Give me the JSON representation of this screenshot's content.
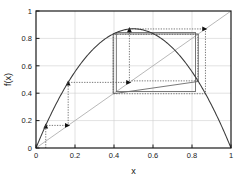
{
  "chart_data": {
    "type": "line",
    "title": "",
    "xlabel": "x",
    "ylabel": "f(x)",
    "xlim": [
      0,
      1
    ],
    "ylim": [
      0,
      1
    ],
    "grid": true,
    "legend": "none",
    "xticks": [
      "0",
      "0.2",
      "0.4",
      "0.6",
      "0.8",
      "1"
    ],
    "xtickvalues": [
      0,
      0.2,
      0.4,
      0.6,
      0.8,
      1
    ],
    "yticks": [
      "0",
      "0.2",
      "0.4",
      "0.6",
      "0.8",
      "1"
    ],
    "ytickvalues": [
      0,
      0.2,
      0.4,
      0.6,
      0.8,
      1
    ],
    "series": [
      {
        "name": "f(x) = r x (1 - x)",
        "style": "solid-curve",
        "r": 3.48,
        "peak": {
          "x": 0.5,
          "y": 0.87
        },
        "x": [
          0.0,
          0.05,
          0.1,
          0.15,
          0.2,
          0.25,
          0.3,
          0.35,
          0.4,
          0.45,
          0.5,
          0.55,
          0.6,
          0.65,
          0.7,
          0.75,
          0.8,
          0.85,
          0.9,
          0.95,
          1.0
        ],
        "values": [
          0.0,
          0.165,
          0.313,
          0.444,
          0.557,
          0.653,
          0.731,
          0.792,
          0.835,
          0.861,
          0.87,
          0.861,
          0.835,
          0.792,
          0.731,
          0.653,
          0.557,
          0.444,
          0.313,
          0.165,
          0.0
        ]
      },
      {
        "name": "identity y = x",
        "style": "solid-diagonal",
        "x": [
          0,
          1
        ],
        "values": [
          0,
          1
        ]
      },
      {
        "name": "cobweb trajectory",
        "style": "dotted-staircase",
        "x0": 0.05,
        "points": [
          {
            "x": 0.05,
            "y": 0.0
          },
          {
            "x": 0.05,
            "y": 0.165
          },
          {
            "x": 0.165,
            "y": 0.165
          },
          {
            "x": 0.165,
            "y": 0.479
          },
          {
            "x": 0.479,
            "y": 0.479
          },
          {
            "x": 0.479,
            "y": 0.869
          },
          {
            "x": 0.869,
            "y": 0.869
          },
          {
            "x": 0.869,
            "y": 0.396
          },
          {
            "x": 0.396,
            "y": 0.396
          },
          {
            "x": 0.396,
            "y": 0.83
          },
          {
            "x": 0.83,
            "y": 0.83
          },
          {
            "x": 0.83,
            "y": 0.49
          },
          {
            "x": 0.49,
            "y": 0.49
          }
        ],
        "arrow_markers": [
          {
            "x": 0.05,
            "y": 0.165,
            "dir": "up"
          },
          {
            "x": 0.165,
            "y": 0.165,
            "dir": "right"
          },
          {
            "x": 0.165,
            "y": 0.479,
            "dir": "up"
          },
          {
            "x": 0.479,
            "y": 0.479,
            "dir": "right"
          },
          {
            "x": 0.479,
            "y": 0.869,
            "dir": "up"
          },
          {
            "x": 0.869,
            "y": 0.869,
            "dir": "right"
          }
        ]
      },
      {
        "name": "period-2 limit cycle",
        "style": "solid-rectangle",
        "x_low": 0.396,
        "x_high": 0.83,
        "y_low": 0.396,
        "y_high": 0.83
      }
    ],
    "annotations": []
  },
  "style": {
    "axis_color": "#1a1a1a",
    "grid_color": "#cfcfcf",
    "curve_color": "#3a3a3a",
    "diagonal_color": "#b0b0b0",
    "cobweb_color": "#555555",
    "cycle_color": "#6a6a6a",
    "background": "#ffffff"
  }
}
